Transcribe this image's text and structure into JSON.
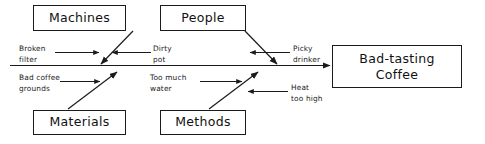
{
  "diagram": {
    "type": "fishbone-cause-and-effect",
    "effect": {
      "line1": "Bad-tasting",
      "line2": "Coffee"
    },
    "categories": [
      {
        "id": "machines",
        "label": "Machines",
        "position": "top-left"
      },
      {
        "id": "people",
        "label": "People",
        "position": "top-right"
      },
      {
        "id": "materials",
        "label": "Materials",
        "position": "bottom-left"
      },
      {
        "id": "methods",
        "label": "Methods",
        "position": "bottom-right"
      }
    ],
    "causes": [
      {
        "id": "broken-filter",
        "text": "Broken\nfilter",
        "category": "machines",
        "side": "left-of-bone"
      },
      {
        "id": "dirty-pot",
        "text": "Dirty\npot",
        "category": "machines",
        "side": "right-of-bone"
      },
      {
        "id": "picky-drinker",
        "text": "Picky\ndrinker",
        "category": "people",
        "side": "right-of-bone"
      },
      {
        "id": "bad-coffee-grounds",
        "text": "Bad coffee\ngrounds",
        "category": "materials",
        "side": "left-of-bone"
      },
      {
        "id": "too-much-water",
        "text": "Too much\nwater",
        "category": "methods",
        "side": "left-of-bone"
      },
      {
        "id": "heat-too-high",
        "text": "Heat\ntoo high",
        "category": "methods",
        "side": "right-of-bone"
      }
    ],
    "colors": {
      "stroke": "#1b1b1b",
      "text": "#111111",
      "background": "#ffffff"
    }
  }
}
